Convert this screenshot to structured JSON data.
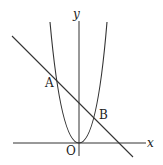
{
  "diagram": {
    "type": "coordinate-plane",
    "stroke_color": "#333333",
    "labels": {
      "y_axis": "y",
      "x_axis": "x",
      "origin": "O",
      "point_a": "A",
      "point_b": "B"
    },
    "elements": {
      "axes": [
        "x-axis",
        "y-axis"
      ],
      "curves": [
        "parabola"
      ],
      "lines": [
        "line-through-A-and-B"
      ],
      "points": [
        "O",
        "A",
        "B"
      ]
    }
  }
}
